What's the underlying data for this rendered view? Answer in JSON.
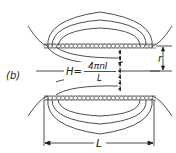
{
  "figure": {
    "panel_label": "(b)",
    "formula": {
      "lhs": "H",
      "equals": "=",
      "numerator": "4πnI",
      "denominator": "L"
    },
    "radius_label": "r",
    "length_label": "L",
    "colors": {
      "line": "#222222",
      "coil": "#555555",
      "background": "#ffffff"
    }
  }
}
